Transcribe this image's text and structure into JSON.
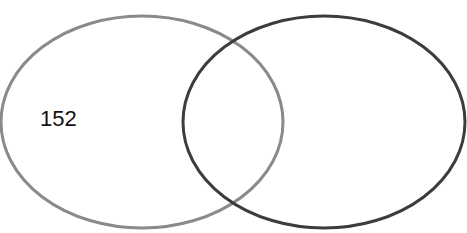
{
  "diagram": {
    "type": "venn",
    "sets": [
      {
        "name": "set-a",
        "label": "",
        "count": "152",
        "stroke": "#8a8a8a",
        "cx": 142,
        "cy": 122,
        "rx": 141,
        "ry": 106
      },
      {
        "name": "set-b",
        "label": "",
        "count": "",
        "stroke": "#3c3c3c",
        "cx": 324,
        "cy": 122,
        "rx": 141,
        "ry": 106
      }
    ],
    "intersection_count": ""
  }
}
